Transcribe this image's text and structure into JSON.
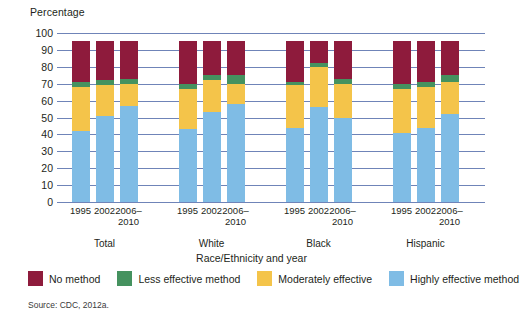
{
  "chart_data": {
    "type": "bar",
    "subtype": "stacked-bar",
    "title": "",
    "ylabel": "Percentage",
    "xlabel": "Race/Ethnicity and year",
    "ylim": [
      0,
      100
    ],
    "yticks": [
      0,
      10,
      20,
      30,
      40,
      50,
      60,
      70,
      80,
      90,
      100
    ],
    "grid": true,
    "legend_position": "bottom",
    "groups": [
      "Total",
      "White",
      "Black",
      "Hispanic"
    ],
    "years": [
      "1995",
      "2002",
      "2006–2010"
    ],
    "categories": [
      "Total 1995",
      "Total 2002",
      "Total 2006–2010",
      "White 1995",
      "White 2002",
      "White 2006–2010",
      "Black 1995",
      "Black 2002",
      "Black 2006–2010",
      "Hispanic 1995",
      "Hispanic 2002",
      "Hispanic 2006–2010"
    ],
    "series": [
      {
        "name": "Highly effective method",
        "color": "#7FBCE5",
        "values": [
          42,
          51,
          57,
          43,
          53,
          58,
          44,
          56,
          50,
          41,
          44,
          52
        ]
      },
      {
        "name": "Moderately effective",
        "color": "#F4C44A",
        "values": [
          26,
          18,
          13,
          24,
          19,
          12,
          25,
          24,
          20,
          26,
          24,
          19
        ]
      },
      {
        "name": "Less effective method",
        "color": "#45925F",
        "values": [
          3,
          3,
          3,
          3,
          3,
          5,
          2,
          2,
          3,
          3,
          3,
          4
        ]
      },
      {
        "name": "No method",
        "color": "#8E1B3C",
        "values": [
          24,
          23,
          22,
          25,
          20,
          20,
          24,
          13,
          22,
          25,
          24,
          20
        ]
      }
    ],
    "stack_order_bottom_to_top": [
      "Highly effective method",
      "Moderately effective",
      "Less effective method",
      "No method"
    ],
    "source": "Source: CDC, 2012a."
  },
  "legend": {
    "items": [
      {
        "label": "No method",
        "color": "#8E1B3C"
      },
      {
        "label": "Less effective method",
        "color": "#45925F"
      },
      {
        "label": "Moderately effective",
        "color": "#F4C44A"
      },
      {
        "label": "Highly effective method",
        "color": "#7FBCE5"
      }
    ]
  },
  "axes": {
    "y_title": "Percentage",
    "x_title": "Race/Ethnicity and year",
    "gridline_color": "#6F84B8"
  },
  "footnote": "Source: CDC, 2012a."
}
